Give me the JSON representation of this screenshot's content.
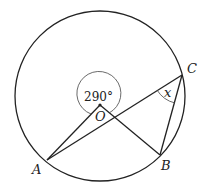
{
  "diagram": {
    "points": {
      "O": "O",
      "A": "A",
      "B": "B",
      "C": "C"
    },
    "reflex_angle_label": "290°",
    "inscribed_angle_label": "x",
    "segments": [
      "OA",
      "OB",
      "AC",
      "BC"
    ],
    "colors": {
      "stroke": "#222222",
      "background": "#ffffff"
    }
  }
}
